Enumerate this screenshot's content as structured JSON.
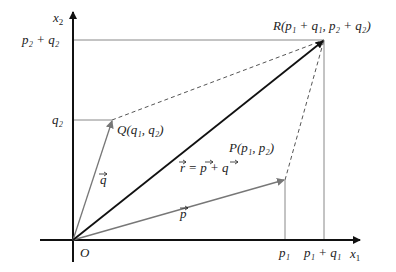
{
  "diagram": {
    "colors": {
      "axis": "#111111",
      "vector_r": "#111111",
      "vector_pq": "#777777",
      "guide": "#888888",
      "dashed": "#555555"
    },
    "axes": {
      "x_label": {
        "base": "x",
        "sub": "1"
      },
      "y_label": {
        "base": "x",
        "sub": "2"
      },
      "origin_label": "O"
    },
    "points": {
      "P": {
        "name": "P",
        "coords": [
          "p",
          "1",
          "p",
          "2"
        ],
        "text": "P(p₁, p₂)"
      },
      "Q": {
        "name": "Q",
        "coords": [
          "q",
          "1",
          "q",
          "2"
        ],
        "text": "Q(q₁, q₂)"
      },
      "R": {
        "name": "R",
        "text": "R(p₁ + q₁, p₂ + q₂)"
      }
    },
    "vectors": {
      "p": "p",
      "q": "q",
      "r_eq": "r = p + q"
    },
    "ticks": {
      "x": [
        {
          "text": "p₁"
        },
        {
          "text": "p₁ + q₁"
        }
      ],
      "y": [
        {
          "text": "q₂"
        },
        {
          "text": "p₂ + q₂"
        }
      ]
    }
  }
}
